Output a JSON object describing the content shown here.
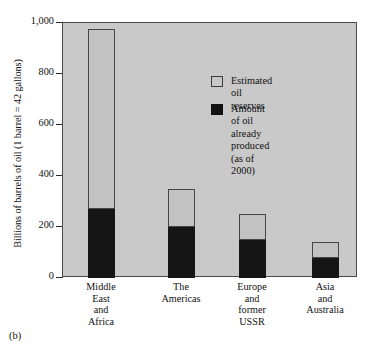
{
  "figure": {
    "panel_label": "(b)",
    "y_axis_title": "Billions of barrels of oil (1 barrel = 42 gallons)"
  },
  "legend": {
    "items": [
      {
        "label": "Estimated oil reserves",
        "color": "#c7c7c7",
        "name": "estimated-oil-reserves"
      },
      {
        "label": "Amount of oil already\nproduced (as of 2000)",
        "color": "#121212",
        "name": "amount-of-oil-already-produced"
      }
    ]
  },
  "axis": {
    "y_ticks": [
      "0",
      "200",
      "400",
      "600",
      "800",
      "1,000"
    ],
    "y_tick_values": [
      0,
      200,
      400,
      600,
      800,
      1000
    ]
  },
  "chart_data": {
    "type": "bar",
    "title": "",
    "subtitle": "",
    "xlabel": "",
    "ylabel": "Billions of barrels of oil (1 barrel = 42 gallons)",
    "ylim": [
      0,
      1000
    ],
    "yticks": [
      0,
      200,
      400,
      600,
      800,
      1000
    ],
    "ytick_labels": [
      "0",
      "200",
      "400",
      "600",
      "800",
      "1,000"
    ],
    "grid": false,
    "stacked": true,
    "legend_position": "inside-top-center",
    "categories": [
      "Middle\nEast\nand\nAfrica",
      "The\nAmericas",
      "Europe\nand\nformer\nUSSR",
      "Asia\nand\nAustralia"
    ],
    "category_labels_flat": [
      "Middle East and Africa",
      "The Americas",
      "Europe and former USSR",
      "Asia and Australia"
    ],
    "series": [
      {
        "name": "Amount of oil already produced (as of 2000)",
        "color": "#121212",
        "values": [
          270,
          200,
          150,
          80
        ]
      },
      {
        "name": "Estimated oil reserves",
        "color": "#c7c7c7",
        "values": [
          705,
          150,
          100,
          60
        ]
      }
    ],
    "totals": [
      975,
      350,
      250,
      140
    ],
    "annotations": [
      "(b)"
    ]
  },
  "bars": [
    {
      "name": "bar-middle-east-africa",
      "left": 87,
      "width": 27,
      "total": 975,
      "produced": 270
    },
    {
      "name": "bar-the-americas",
      "left": 167,
      "width": 27,
      "total": 350,
      "produced": 200
    },
    {
      "name": "bar-europe-former-ussr",
      "left": 238,
      "width": 27,
      "total": 250,
      "produced": 150
    },
    {
      "name": "bar-asia-australia",
      "left": 311,
      "width": 27,
      "total": 140,
      "produced": 80
    }
  ],
  "x_labels": [
    {
      "text": "Middle\nEast\nand\nAfrica",
      "left": 70,
      "width": 62
    },
    {
      "text": "The\nAmericas",
      "left": 148,
      "width": 66
    },
    {
      "text": "Europe\nand\nformer\nUSSR",
      "left": 220,
      "width": 64
    },
    {
      "text": "Asia\nand\nAustralia",
      "left": 290,
      "width": 70
    }
  ]
}
